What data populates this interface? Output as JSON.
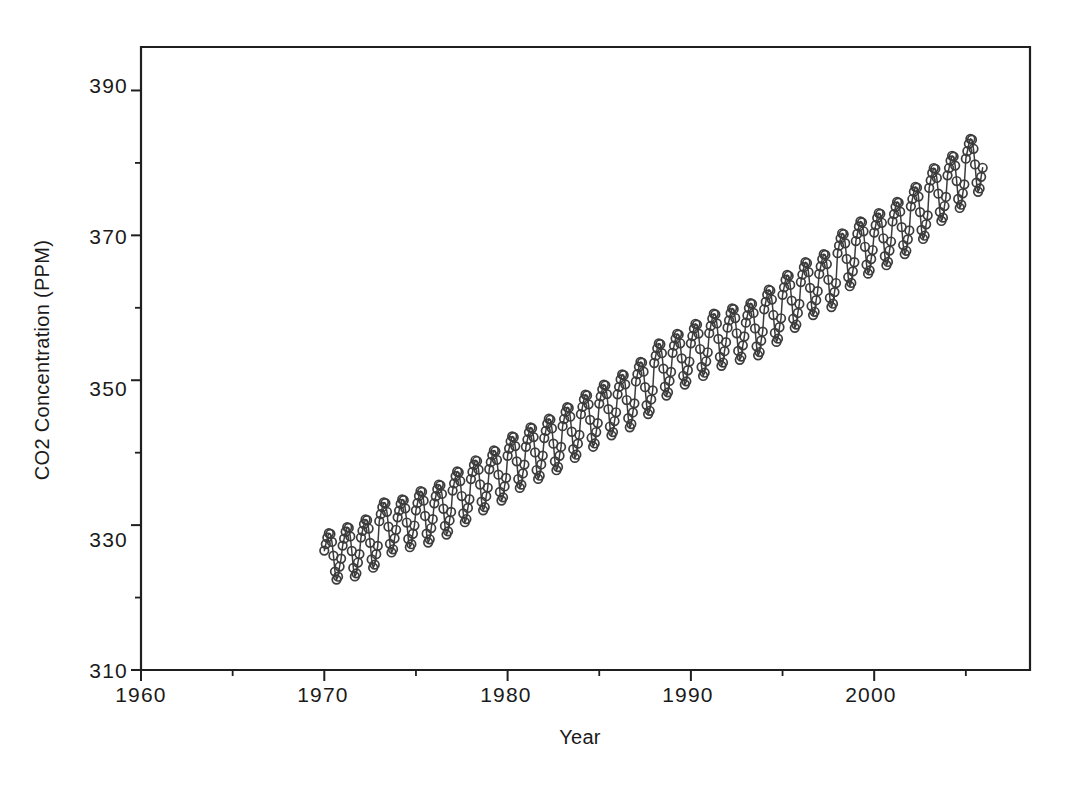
{
  "figure": {
    "background_color": "#ffffff",
    "frame_color": "#1f1f1f",
    "marker_color": "#3c3c3c",
    "line_color": "#3c3c3c"
  },
  "labels": {
    "x_axis_title": "Year",
    "y_axis_title": "CO2 Concentration (PPM)",
    "x_tick_1960": "1960",
    "x_tick_1970": "1970",
    "x_tick_1980": "1980",
    "x_tick_1990": "1990",
    "x_tick_2000": "2000",
    "y_tick_310": "310",
    "y_tick_330": "330",
    "y_tick_350": "350",
    "y_tick_370": "370",
    "y_tick_390": "390"
  },
  "chart_data": {
    "type": "scatter",
    "title": "",
    "subtitle": "",
    "xlabel": "Year",
    "ylabel": "CO2 Concentration (PPM)",
    "xlim": [
      1960,
      2008.5
    ],
    "ylim": [
      310,
      396
    ],
    "grid": false,
    "legend": null,
    "x_ticks_major": [
      1960,
      1970,
      1980,
      1990,
      2000
    ],
    "x_ticks_minor": [
      1965,
      1975,
      1985,
      1995,
      2005
    ],
    "y_ticks_major": [
      310,
      330,
      350,
      370,
      390
    ],
    "y_ticks_minor": [
      320,
      340,
      360,
      380
    ],
    "marker": "open-circle",
    "marker_size": 5,
    "series": [
      {
        "name": "Monthly CO2 (PPM)",
        "type": "scatter",
        "x": [
          1970,
          1971,
          1972,
          1973,
          1974,
          1975,
          1976,
          1977,
          1978,
          1979,
          1980,
          1981,
          1982,
          1983,
          1984,
          1985,
          1986,
          1987,
          1988,
          1989,
          1990,
          1991,
          1992,
          1993,
          1994,
          1995,
          1996,
          1997,
          1998,
          1999,
          2000,
          2001,
          2002,
          2003,
          2004,
          2005
        ],
        "annual_mean": [
          325.68,
          326.32,
          327.45,
          329.68,
          330.25,
          331.15,
          332.15,
          333.9,
          335.5,
          336.85,
          338.69,
          339.93,
          341.13,
          342.78,
          344.42,
          345.9,
          347.15,
          348.93,
          351.48,
          352.91,
          354.19,
          355.59,
          356.37,
          357.04,
          358.89,
          360.88,
          362.64,
          363.76,
          366.63,
          368.31,
          369.48,
          371.02,
          373.1,
          375.64,
          377.38,
          379.67
        ],
        "annual_min": [
          322.5,
          322.9,
          324.15,
          326.2,
          327.0,
          327.6,
          328.7,
          330.4,
          332.1,
          333.4,
          335.1,
          336.4,
          337.6,
          339.3,
          340.8,
          342.4,
          343.5,
          345.3,
          347.9,
          349.4,
          350.6,
          352.0,
          352.8,
          353.4,
          355.3,
          357.2,
          359.0,
          360.1,
          363.0,
          364.7,
          365.9,
          367.4,
          369.5,
          372.0,
          373.8,
          376.0
        ],
        "annual_max": [
          328.9,
          329.7,
          330.8,
          333.1,
          333.6,
          334.7,
          335.6,
          337.4,
          339.0,
          340.3,
          342.2,
          343.5,
          344.7,
          346.3,
          348.0,
          349.4,
          350.8,
          352.5,
          355.1,
          356.4,
          357.8,
          359.2,
          359.9,
          360.6,
          362.5,
          364.5,
          366.3,
          367.4,
          370.3,
          371.9,
          373.1,
          374.6,
          376.7,
          379.3,
          381.0,
          383.3
        ],
        "monthly_offsets": [
          0.8,
          1.7,
          2.6,
          3.2,
          3.1,
          2.0,
          0.1,
          -2.1,
          -3.2,
          -2.8,
          -1.4,
          -0.3
        ]
      }
    ]
  }
}
